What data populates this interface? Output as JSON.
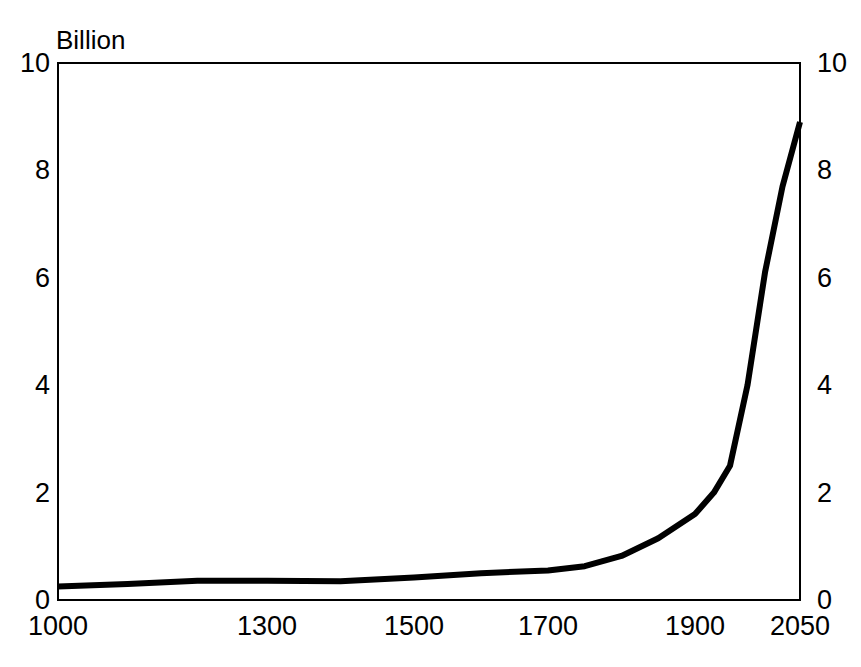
{
  "chart_data": {
    "type": "line",
    "title": "",
    "subtitle": "",
    "unit_label": "Billion",
    "xlabel": "",
    "ylabel": "",
    "ylim": [
      0,
      10
    ],
    "y_ticks": [
      "0",
      "2",
      "4",
      "6",
      "8",
      "10"
    ],
    "y_tick_values": [
      0,
      2,
      4,
      6,
      8,
      10
    ],
    "y_axis_right_ticks": [
      "0",
      "2",
      "4",
      "6",
      "8",
      "10"
    ],
    "x_ticks": [
      "1000",
      "1300",
      "1500",
      "1700",
      "1900",
      "2050"
    ],
    "x_tick_values": [
      1000,
      1300,
      1500,
      1700,
      1900,
      2050
    ],
    "grid": false,
    "legend": null,
    "legend_position": "none",
    "series": [
      {
        "name": "World population",
        "x": [
          1000,
          1100,
          1200,
          1300,
          1400,
          1500,
          1600,
          1700,
          1750,
          1800,
          1850,
          1900,
          1927,
          1950,
          1975,
          2000,
          2025,
          2050
        ],
        "values": [
          0.25,
          0.3,
          0.36,
          0.36,
          0.35,
          0.42,
          0.5,
          0.55,
          0.63,
          0.82,
          1.15,
          1.6,
          2.0,
          2.5,
          4.0,
          6.1,
          7.7,
          8.9
        ]
      }
    ]
  },
  "annotations": {
    "line_color": "#000000",
    "frame_color": "#000000",
    "background_color": "#ffffff"
  }
}
